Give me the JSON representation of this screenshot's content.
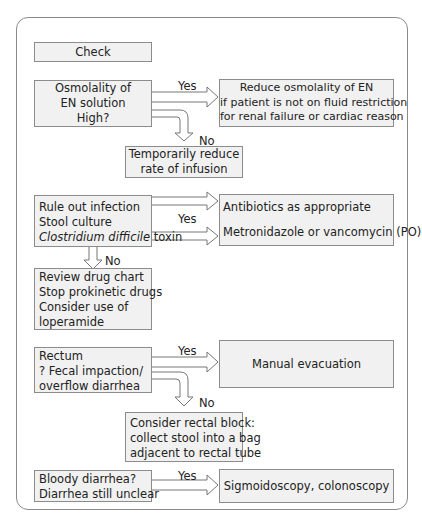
{
  "colors": {
    "box_fill": "#f1f1f1",
    "box_border": "#8c8c8c",
    "frame_border": "#8a8a8a",
    "text": "#222222"
  },
  "check": {
    "label": "Check"
  },
  "osmolality": {
    "question": [
      "Osmolality of",
      "EN solution",
      "High?"
    ],
    "yes_label": "Yes",
    "yes_action": [
      "Reduce osmolality of EN",
      "if patient is not on fluid restriction",
      "for renal failure or cardiac reason"
    ],
    "no_label": "No",
    "no_action": [
      "Temporarily reduce",
      "rate of infusion"
    ]
  },
  "infection": {
    "question": [
      "Rule out infection",
      "Stool culture"
    ],
    "question_italic": "Clostridium difficile",
    "question_tail": " toxin",
    "yes_label": "Yes",
    "yes_actions": [
      "Antibiotics as appropriate",
      "Metronidazole or vancomycin (PO)"
    ],
    "no_label": "No",
    "no_action": [
      "Review drug chart",
      "Stop prokinetic drugs",
      "Consider use of",
      "loperamide"
    ]
  },
  "rectum": {
    "question": [
      "Rectum",
      "? Fecal impaction/",
      "overflow diarrhea"
    ],
    "yes_label": "Yes",
    "yes_action": "Manual evacuation",
    "no_label": "No",
    "no_action": [
      "Consider rectal block:",
      "collect stool into a bag",
      "adjacent to rectal tube"
    ]
  },
  "bloody": {
    "question": [
      "Bloody diarrhea?",
      "Diarrhea still unclear"
    ],
    "yes_label": "Yes",
    "yes_action": "Sigmoidoscopy, colonoscopy"
  }
}
